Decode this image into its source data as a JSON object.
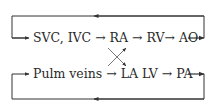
{
  "diagram": {
    "title": "",
    "colors": {
      "line": "#333333",
      "text": "#2a2a2a",
      "background": "#ffffff"
    },
    "rows": [
      {
        "label": "SVC, IVC → RA → RV→ AO"
      },
      {
        "label": "Pulm veins → LA LV → PA"
      }
    ],
    "loops": [
      {
        "name": "top-loop",
        "direction": "right-to-left on top line, feeds into row 1"
      },
      {
        "name": "bottom-loop",
        "direction": "right-to-left on bottom line, feeds into row 2"
      }
    ],
    "cross": {
      "from": [
        "RA",
        "LA"
      ],
      "to": [
        "RV",
        "LV"
      ],
      "type": "crossed arrows"
    }
  }
}
